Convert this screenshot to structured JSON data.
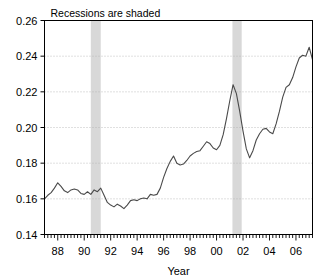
{
  "chart_data": {
    "type": "line",
    "title": "Recessions are shaded",
    "xlabel": "Year",
    "ylabel": "",
    "xlim": [
      1987.0,
      2007.25
    ],
    "ylim": [
      0.14,
      0.26
    ],
    "grid": true,
    "legend": null,
    "x_tick_labels": [
      "88",
      "90",
      "92",
      "94",
      "96",
      "98",
      "00",
      "02",
      "04",
      "06"
    ],
    "x_tick_values": [
      1988,
      1990,
      1992,
      1994,
      1996,
      1998,
      2000,
      2002,
      2004,
      2006
    ],
    "x_minor_tick_interval": 0.25,
    "y_tick_labels": [
      "0.14",
      "0.16",
      "0.18",
      "0.20",
      "0.22",
      "0.24",
      "0.26"
    ],
    "y_tick_values": [
      0.14,
      0.16,
      0.18,
      0.2,
      0.22,
      0.24,
      0.26
    ],
    "line_color": "#4a4a4a",
    "shade_color": "#d8d8d8",
    "frame_color": "#000000",
    "grid_color": "#b0b0b0",
    "shaded_regions": [
      {
        "label": "recession-1990",
        "start": 1990.5,
        "end": 1991.25
      },
      {
        "label": "recession-2001",
        "start": 2001.2,
        "end": 2001.9
      }
    ],
    "series": [
      {
        "name": "ratio",
        "x": [
          1987.0,
          1987.25,
          1987.5,
          1987.75,
          1988.0,
          1988.25,
          1988.5,
          1988.75,
          1989.0,
          1989.25,
          1989.5,
          1989.75,
          1990.0,
          1990.25,
          1990.5,
          1990.75,
          1991.0,
          1991.25,
          1991.5,
          1991.75,
          1992.0,
          1992.25,
          1992.5,
          1992.75,
          1993.0,
          1993.25,
          1993.5,
          1993.75,
          1994.0,
          1994.25,
          1994.5,
          1994.75,
          1995.0,
          1995.25,
          1995.5,
          1995.75,
          1996.0,
          1996.25,
          1996.5,
          1996.75,
          1997.0,
          1997.25,
          1997.5,
          1997.75,
          1998.0,
          1998.25,
          1998.5,
          1998.75,
          1999.0,
          1999.25,
          1999.5,
          1999.75,
          2000.0,
          2000.25,
          2000.5,
          2000.75,
          2001.0,
          2001.25,
          2001.5,
          2001.75,
          2002.0,
          2002.25,
          2002.5,
          2002.75,
          2003.0,
          2003.25,
          2003.5,
          2003.75,
          2004.0,
          2004.25,
          2004.5,
          2004.75,
          2005.0,
          2005.25,
          2005.5,
          2005.75,
          2006.0,
          2006.25,
          2006.5,
          2006.75,
          2007.0,
          2007.25
        ],
        "y": [
          0.16,
          0.162,
          0.1635,
          0.166,
          0.169,
          0.167,
          0.1645,
          0.1635,
          0.165,
          0.1655,
          0.165,
          0.163,
          0.1625,
          0.164,
          0.1625,
          0.165,
          0.164,
          0.166,
          0.162,
          0.158,
          0.1565,
          0.1555,
          0.157,
          0.156,
          0.1545,
          0.1565,
          0.159,
          0.1595,
          0.159,
          0.16,
          0.1605,
          0.16,
          0.1625,
          0.162,
          0.1625,
          0.166,
          0.172,
          0.177,
          0.181,
          0.184,
          0.18,
          0.179,
          0.1795,
          0.1815,
          0.184,
          0.1855,
          0.1865,
          0.187,
          0.1895,
          0.192,
          0.191,
          0.1885,
          0.1875,
          0.19,
          0.196,
          0.205,
          0.215,
          0.224,
          0.219,
          0.209,
          0.198,
          0.188,
          0.183,
          0.187,
          0.193,
          0.1965,
          0.199,
          0.1995,
          0.1975,
          0.1965,
          0.202,
          0.209,
          0.217,
          0.2225,
          0.224,
          0.228,
          0.234,
          0.239,
          0.2405,
          0.24,
          0.245,
          0.238
        ]
      }
    ]
  }
}
